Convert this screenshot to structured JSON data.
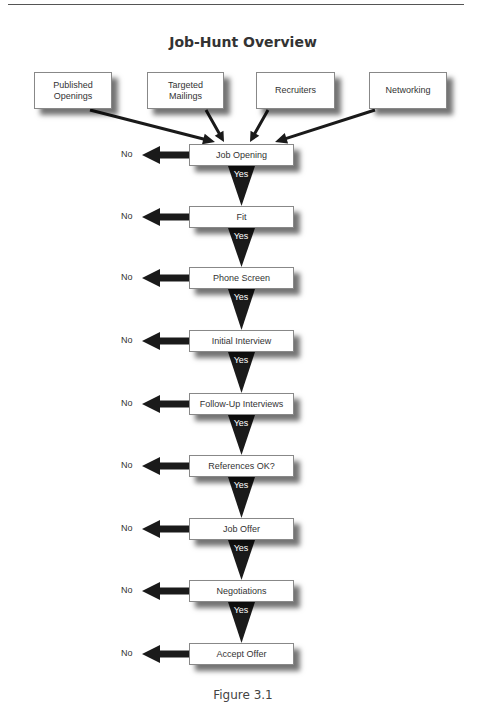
{
  "title": "Job-Hunt Overview",
  "caption": "Figure 3.1",
  "sources": [
    {
      "label": "Published\nOpenings",
      "x": 34,
      "w": 78
    },
    {
      "label": "Targeted\nMailings",
      "x": 147,
      "w": 77
    },
    {
      "label": "Recruiters",
      "x": 256,
      "w": 79
    },
    {
      "label": "Networking",
      "x": 369,
      "w": 78
    }
  ],
  "steps": [
    {
      "label": "Job Opening",
      "top": 144
    },
    {
      "label": "Fit",
      "top": 206
    },
    {
      "label": "Phone Screen",
      "top": 267
    },
    {
      "label": "Initial Interview",
      "top": 330
    },
    {
      "label": "Follow-Up Interviews",
      "top": 393
    },
    {
      "label": "References OK?",
      "top": 455
    },
    {
      "label": "Job Offer",
      "top": 518
    },
    {
      "label": "Negotiations",
      "top": 580
    },
    {
      "label": "Accept Offer",
      "top": 643
    }
  ],
  "no_label": "No",
  "yes_label": "Yes",
  "colors": {
    "arrow": "#1a1a1a",
    "box_border": "#888888",
    "text": "#333333"
  }
}
